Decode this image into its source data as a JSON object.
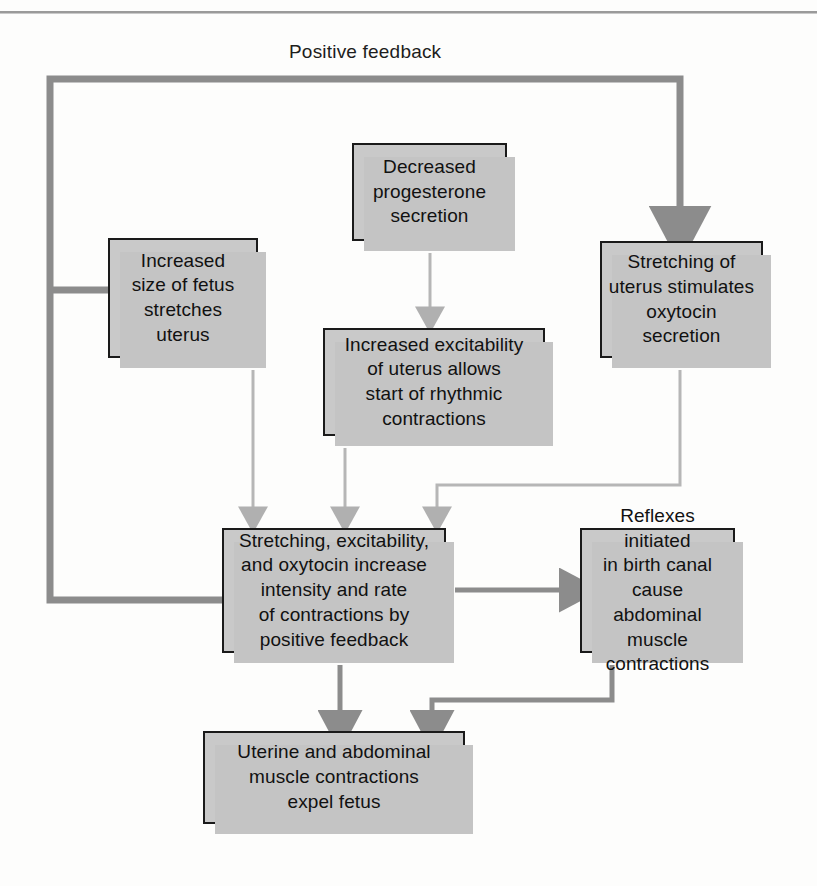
{
  "figure": {
    "caption": "Positive feedback",
    "colors": {
      "box_fill": "#c9c9c9",
      "box_border": "#1a1a1a",
      "shadow": "#c4c4c4",
      "thick_connector": "#8c8c8c",
      "thin_connector": "#b6b6b6",
      "text": "#111111",
      "page": "#fdfdfc"
    }
  },
  "nodes": {
    "progesterone": {
      "text": "Decreased\nprogesterone\nsecretion"
    },
    "fetus": {
      "text": "Increased\nsize of fetus\nstretches\nuterus"
    },
    "oxytocin": {
      "text": "Stretching of\nuterus stimulates\noxytocin\nsecretion"
    },
    "excitability": {
      "text": "Increased excitability\nof uterus allows\nstart of rhythmic\ncontractions"
    },
    "main": {
      "text": "Stretching, excitability,\nand oxytocin increase\nintensity and rate\nof contractions by\npositive feedback"
    },
    "reflexes": {
      "text": "Reflexes initiated\nin birth canal\ncause abdominal\nmuscle\ncontractions"
    },
    "bottom": {
      "text": "Uterine and abdominal\nmuscle contractions\nexpel fetus"
    }
  },
  "edges": [
    {
      "id": "feedback-loop-to-oxytocin",
      "from": "main",
      "to": "oxytocin",
      "style": "thick",
      "label": "Positive feedback"
    },
    {
      "id": "feedback-loop-to-fetus",
      "from": "main",
      "to": "fetus",
      "style": "thick"
    },
    {
      "id": "progesterone-to-excitability",
      "from": "progesterone",
      "to": "excitability",
      "style": "thin"
    },
    {
      "id": "fetus-to-main",
      "from": "fetus",
      "to": "main",
      "style": "thin"
    },
    {
      "id": "excitability-to-main",
      "from": "excitability",
      "to": "main",
      "style": "thin"
    },
    {
      "id": "oxytocin-to-main",
      "from": "oxytocin",
      "to": "main",
      "style": "thin"
    },
    {
      "id": "main-to-reflexes",
      "from": "main",
      "to": "reflexes",
      "style": "thick"
    },
    {
      "id": "main-to-bottom",
      "from": "main",
      "to": "bottom",
      "style": "thick"
    },
    {
      "id": "reflexes-to-bottom",
      "from": "reflexes",
      "to": "bottom",
      "style": "thick"
    }
  ]
}
